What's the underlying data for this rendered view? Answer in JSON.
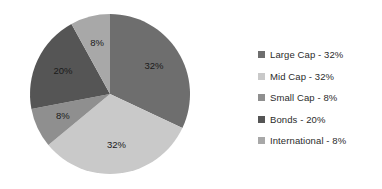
{
  "chart_data": {
    "type": "pie",
    "title": "",
    "subtitle": "",
    "xlabel": "",
    "ylabel": "",
    "grid": false,
    "legend_position": "right",
    "labels": [
      "Large Cap",
      "Mid Cap",
      "Small Cap",
      "Bonds",
      "International"
    ],
    "values": [
      32,
      32,
      8,
      20,
      8
    ],
    "value_suffix": "%",
    "start_angle_deg": 0,
    "direction": "clockwise",
    "data_labels": [
      "32%",
      "32%",
      "8%",
      "20%",
      "8%"
    ],
    "colors": [
      "#6e6e6e",
      "#c9c9c9",
      "#8f8f8f",
      "#555555",
      "#a8a8a8"
    ],
    "legend_entries": [
      {
        "label": "Large Cap - 32%",
        "color": "#6e6e6e"
      },
      {
        "label": "Mid Cap - 32%",
        "color": "#c9c9c9"
      },
      {
        "label": "Small Cap - 8%",
        "color": "#8f8f8f"
      },
      {
        "label": "Bonds - 20%",
        "color": "#555555"
      },
      {
        "label": "International - 8%",
        "color": "#a8a8a8"
      }
    ]
  },
  "geometry": {
    "center_x": 110,
    "center_y": 94,
    "radius": 80,
    "label_radius": 52
  }
}
